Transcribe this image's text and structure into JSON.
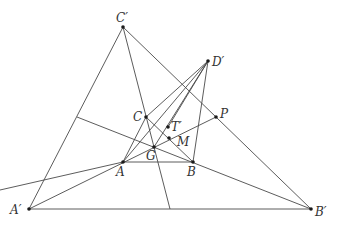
{
  "diagram": {
    "type": "geometry",
    "canvas": {
      "width": 337,
      "height": 226
    },
    "line_color": "#4a4a4a",
    "point_color": "#1a1a1a",
    "label_color": "#333333",
    "points": [
      {
        "id": "Cp",
        "label": "C′",
        "x": 123,
        "y": 27,
        "lx": 116,
        "ly": 22
      },
      {
        "id": "Dp",
        "label": "D′",
        "x": 208,
        "y": 61,
        "lx": 212,
        "ly": 66
      },
      {
        "id": "C",
        "label": "C",
        "x": 146,
        "y": 117,
        "lx": 133,
        "ly": 121
      },
      {
        "id": "P",
        "label": "P",
        "x": 216,
        "y": 117,
        "lx": 220,
        "ly": 118
      },
      {
        "id": "Tp",
        "label": "T′",
        "x": 168,
        "y": 127,
        "lx": 171,
        "ly": 131
      },
      {
        "id": "M",
        "label": "M",
        "x": 169,
        "y": 138,
        "lx": 177,
        "ly": 146
      },
      {
        "id": "G",
        "label": "G",
        "x": 154,
        "y": 147,
        "lx": 146,
        "ly": 160
      },
      {
        "id": "A",
        "label": "A",
        "x": 123,
        "y": 162,
        "lx": 116,
        "ly": 176
      },
      {
        "id": "B",
        "label": "B",
        "x": 193,
        "y": 162,
        "lx": 187,
        "ly": 176
      },
      {
        "id": "Ap",
        "label": "A′",
        "x": 29,
        "y": 209,
        "lx": 10,
        "ly": 214
      },
      {
        "id": "Bp",
        "label": "B′",
        "x": 311,
        "y": 209,
        "lx": 315,
        "ly": 216
      }
    ],
    "segments": [
      {
        "name": "side-ap-cp",
        "x1": 29,
        "y1": 209,
        "x2": 123,
        "y2": 27
      },
      {
        "name": "side-cp-bp",
        "x1": 123,
        "y1": 27,
        "x2": 311,
        "y2": 209
      },
      {
        "name": "side-ap-bp",
        "x1": 29,
        "y1": 209,
        "x2": 311,
        "y2": 209
      },
      {
        "name": "side-a-b",
        "x1": 123,
        "y1": 162,
        "x2": 193,
        "y2": 162
      },
      {
        "name": "side-c-a",
        "x1": 146,
        "y1": 117,
        "x2": 123,
        "y2": 162
      },
      {
        "name": "side-c-b",
        "x1": 146,
        "y1": 117,
        "x2": 193,
        "y2": 162
      },
      {
        "name": "cevian-cp-c-g",
        "x1": 123,
        "y1": 27,
        "x2": 170,
        "y2": 209
      },
      {
        "name": "line-ap-a-p",
        "x1": 29,
        "y1": 209,
        "x2": 216,
        "y2": 117
      },
      {
        "name": "line-bp-b-side",
        "x1": 311,
        "y1": 209,
        "x2": 77,
        "y2": 117
      },
      {
        "name": "dp-a",
        "x1": 208,
        "y1": 61,
        "x2": 123,
        "y2": 162
      },
      {
        "name": "dp-g",
        "x1": 208,
        "y1": 61,
        "x2": 154,
        "y2": 147
      },
      {
        "name": "dp-c",
        "x1": 208,
        "y1": 61,
        "x2": 146,
        "y2": 117
      },
      {
        "name": "dp-tp",
        "x1": 208,
        "y1": 61,
        "x2": 168,
        "y2": 127
      },
      {
        "name": "dp-b",
        "x1": 208,
        "y1": 61,
        "x2": 193,
        "y2": 162
      },
      {
        "name": "left-line",
        "x1": 0,
        "y1": 190,
        "x2": 123,
        "y2": 162
      }
    ]
  }
}
